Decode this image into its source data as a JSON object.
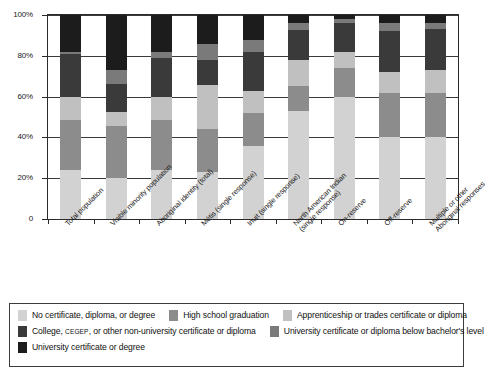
{
  "chart_data": {
    "type": "bar",
    "subtype": "stacked-100-percent",
    "title": "",
    "xlabel": "",
    "ylabel": "",
    "ylim": [
      0,
      100
    ],
    "ytick_labels": [
      "100%",
      "80%",
      "60%",
      "40%",
      "20%",
      "0"
    ],
    "ytick_values": [
      100,
      80,
      60,
      40,
      20,
      0
    ],
    "grid": "horizontal",
    "legend_position": "bottom",
    "categories": [
      "Total population",
      "Visible minority population",
      "Aboriginal identity (total)",
      "Métis (single response)",
      "Inuit (single response)",
      "North American Indian\n(single response)",
      "On-reserve",
      "Off-reserve",
      "Multiple or other\nAboriginal responses"
    ],
    "series": [
      {
        "name": "No certificate, diploma, or degree",
        "color": "#d2d2d2",
        "values": [
          24,
          20,
          24,
          23,
          36,
          53,
          60,
          40,
          40
        ]
      },
      {
        "name": "High school graduation",
        "color": "#8c8c8c",
        "values": [
          24.5,
          25.5,
          24.5,
          21,
          16,
          12,
          14,
          22,
          22
        ]
      },
      {
        "name": "Apprenticeship or trades certificate or diploma",
        "color": "#c0c0c0",
        "values": [
          11.5,
          7,
          11.5,
          21.5,
          11,
          13,
          8,
          10,
          11
        ]
      },
      {
        "name": "College, CEGEP, or other non-university certificate or diploma",
        "color": "#3a3a3a",
        "values": [
          21,
          13.5,
          19,
          12.5,
          19,
          14.5,
          14,
          20,
          20
        ]
      },
      {
        "name": "University certificate or diploma below bachelor's level",
        "color": "#7a7a7a",
        "values": [
          1,
          7,
          3,
          8,
          6,
          3.5,
          2,
          4,
          3
        ]
      },
      {
        "name": "University certificate or degree",
        "color": "#1c1c1c",
        "values": [
          18,
          27,
          18,
          14,
          12,
          4,
          2,
          4,
          4
        ]
      }
    ]
  },
  "legend": {
    "rows": [
      [
        {
          "label": "No certificate, diploma, or degree",
          "color": "#d2d2d2",
          "smallcaps": ""
        },
        {
          "label": "High school graduation",
          "color": "#8c8c8c",
          "smallcaps": ""
        },
        {
          "label": "Apprenticeship or trades certificate or diploma",
          "color": "#c0c0c0",
          "smallcaps": ""
        }
      ],
      [
        {
          "label": "College, CEGEP, or other non-university certificate or diploma",
          "color": "#3a3a3a",
          "smallcaps": "CEGEP"
        },
        {
          "label": "University certificate or diploma below bachelor's level",
          "color": "#7a7a7a",
          "smallcaps": ""
        }
      ],
      [
        {
          "label": "University certificate or degree",
          "color": "#1c1c1c",
          "smallcaps": ""
        }
      ]
    ]
  },
  "colors": {
    "axis": "#2b2b2b",
    "grid": "#3a3a3a",
    "background": "#ffffff"
  }
}
